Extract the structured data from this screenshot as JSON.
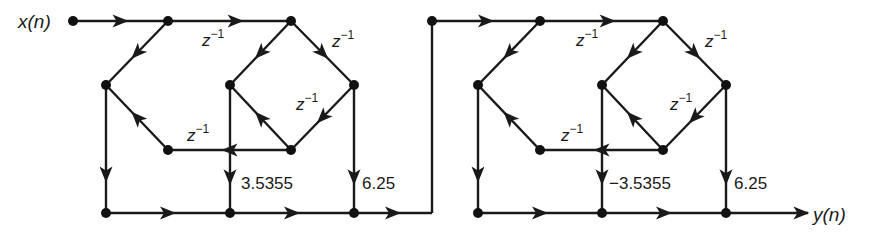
{
  "diagram": {
    "type": "signal-flow-graph",
    "input_label": "x(n)",
    "output_label": "y(n)",
    "delay_symbol": "z",
    "delay_exponent": "−1",
    "sections": [
      {
        "name": "section-1",
        "multipliers": [
          "3.5355",
          "6.25"
        ],
        "delay_count": 4
      },
      {
        "name": "section-2",
        "multipliers": [
          "−3.5355",
          "6.25"
        ],
        "delay_count": 4
      }
    ],
    "gain_labels": {
      "s1_g1": "3.5355",
      "s1_g2": "6.25",
      "s2_g1": "−3.5355",
      "s2_g2": "6.25"
    }
  }
}
